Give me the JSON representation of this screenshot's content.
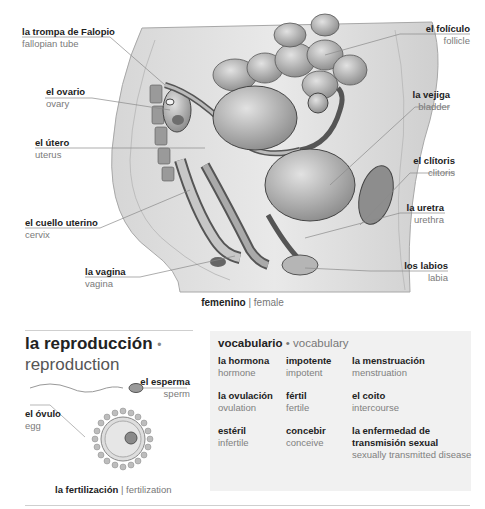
{
  "diagram": {
    "labels": [
      {
        "es": "la trompa de Falopio",
        "en": "fallopian tube"
      },
      {
        "es": "el ovario",
        "en": "ovary"
      },
      {
        "es": "el útero",
        "en": "uterus"
      },
      {
        "es": "el cuello uterino",
        "en": "cervix"
      },
      {
        "es": "la vagina",
        "en": "vagina"
      },
      {
        "es": "el folículo",
        "en": "follicle"
      },
      {
        "es": "la vejiga",
        "en": "bladder"
      },
      {
        "es": "el clítoris",
        "en": "clitoris"
      },
      {
        "es": "la uretra",
        "en": "urethra"
      },
      {
        "es": "los labios",
        "en": "labia"
      }
    ],
    "caption": {
      "es": "femenino",
      "sep": "|",
      "en": "female"
    }
  },
  "reproduction": {
    "title_es": "la reproducción",
    "dot": "•",
    "title_en": "reproduction",
    "labels": [
      {
        "es": "el esperma",
        "en": "sperm"
      },
      {
        "es": "el óvulo",
        "en": "egg"
      }
    ],
    "caption": {
      "es": "la fertilización",
      "sep": "|",
      "en": "fertilization"
    }
  },
  "vocabulary": {
    "title_es": "vocabulario",
    "dot": "•",
    "title_en": "vocabulary",
    "items": [
      {
        "es": "la hormona",
        "en": "hormone"
      },
      {
        "es": "impotente",
        "en": "impotent"
      },
      {
        "es": "la menstruación",
        "en": "menstruation"
      },
      {
        "es": "la ovulación",
        "en": "ovulation"
      },
      {
        "es": "fértil",
        "en": "fertile"
      },
      {
        "es": "el coito",
        "en": "intercourse"
      },
      {
        "es": "estéril",
        "en": "infertile"
      },
      {
        "es": "concebir",
        "en": "conceive"
      },
      {
        "es": "la enfermedad de transmisión sexual",
        "en": "sexually transmitted disease"
      }
    ]
  }
}
